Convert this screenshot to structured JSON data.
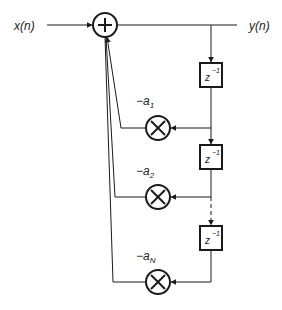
{
  "diagram": {
    "type": "IIR all-pole filter block diagram",
    "input_label": "x(n)",
    "output_label": "y(n)",
    "adder": {
      "symbol": "+"
    },
    "delays": [
      {
        "label_base": "z",
        "label_exp": "−1"
      },
      {
        "label_base": "z",
        "label_exp": "−1"
      },
      {
        "label_base": "z",
        "label_exp": "−1"
      }
    ],
    "multipliers": [
      {
        "coef_prefix": "−a",
        "coef_sub": "1",
        "symbol": "×"
      },
      {
        "coef_prefix": "−a",
        "coef_sub": "2",
        "symbol": "×"
      },
      {
        "coef_prefix": "−a",
        "coef_sub": "N",
        "symbol": "×"
      }
    ],
    "colors": {
      "stroke": "#1a1a1a",
      "text": "#222222"
    }
  }
}
